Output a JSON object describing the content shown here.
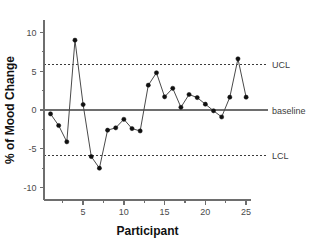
{
  "chart_data": {
    "type": "line",
    "title": "",
    "subtitle": "",
    "xlabel": "Participant",
    "ylabel": "% of Mood Change",
    "xlim": [
      0.2,
      25.6
    ],
    "ylim": [
      -11.6,
      11.6
    ],
    "grid": false,
    "legend_position": "right-outside",
    "x": [
      1,
      2,
      3,
      4,
      5,
      6,
      7,
      8,
      9,
      10,
      11,
      12,
      13,
      14,
      15,
      16,
      17,
      18,
      19,
      20,
      21,
      22,
      23,
      24,
      25
    ],
    "series": [
      {
        "name": "% of Mood Change",
        "marker": "filled-circle",
        "color": "#101010",
        "values": [
          -0.5,
          -2.0,
          -4.1,
          9.0,
          0.7,
          -6.0,
          -7.5,
          -2.6,
          -2.3,
          -1.2,
          -2.4,
          -2.7,
          3.2,
          4.8,
          1.7,
          2.8,
          0.35,
          2.0,
          1.6,
          0.75,
          -0.1,
          -0.9,
          1.65,
          6.6,
          1.65
        ]
      }
    ],
    "x_ticks": [
      5,
      10,
      15,
      20,
      25
    ],
    "x_tick_labels": [
      "5",
      "10",
      "15",
      "20",
      "25"
    ],
    "x_minor_ticks": [
      2.5,
      7.5,
      12.5,
      17.5,
      22.5
    ],
    "y_ticks": [
      10,
      5,
      0,
      -5,
      -10
    ],
    "y_tick_labels": [
      "10",
      "5",
      "0",
      "-5",
      "-10"
    ],
    "y_minor_ticks": [
      7.5,
      2.5,
      -2.5,
      -7.5
    ],
    "reference_lines": [
      {
        "name": "UCL",
        "label": "UCL",
        "value": 5.9,
        "style": "dashed",
        "color": "#3a3a3a"
      },
      {
        "name": "baseline",
        "label": "baseline",
        "value": 0,
        "style": "solid",
        "color": "#6e6e6e"
      },
      {
        "name": "LCL",
        "label": "LCL",
        "value": -5.8,
        "style": "dashed",
        "color": "#3a3a3a"
      }
    ]
  },
  "figure": {
    "y_axis_title": "% of Mood Change",
    "x_axis_title": "Participant",
    "ucl_label": "UCL",
    "baseline_label": "baseline",
    "lcl_label": "LCL",
    "ytick_10": "10",
    "ytick_5": "5",
    "ytick_0": "0",
    "ytick_m5": "-5",
    "ytick_m10": "-10",
    "xtick_5": "5",
    "xtick_10": "10",
    "xtick_15": "15",
    "xtick_20": "20",
    "xtick_25": "25"
  }
}
